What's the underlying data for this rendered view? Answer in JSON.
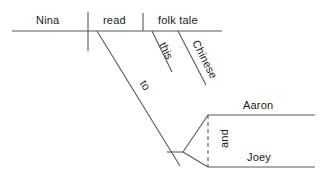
{
  "diagram": {
    "type": "reed-kellogg-sentence-diagram",
    "sentence": "Nina read this folk tale to Aaron and Joey.",
    "line_color": "#595959",
    "text_color": "#1a1a1a",
    "baseline": {
      "subject": "Nina",
      "verb": "read",
      "direct_object": "folk tale"
    },
    "modifiers": [
      {
        "word": "this",
        "modifies": "folk tale"
      },
      {
        "word": "Chinese",
        "modifies": "folk tale"
      }
    ],
    "prepositional_phrase": {
      "preposition": "to",
      "objects": [
        "Aaron",
        "Joey"
      ],
      "conjunction": "and"
    }
  },
  "labels": {
    "subject": "Nina",
    "verb": "read",
    "object": "folk tale",
    "mod_this": "this",
    "mod_chinese": "Chinese",
    "prep_to": "to",
    "obj_aaron": "Aaron",
    "obj_joey": "Joey",
    "conj_and": "and"
  }
}
